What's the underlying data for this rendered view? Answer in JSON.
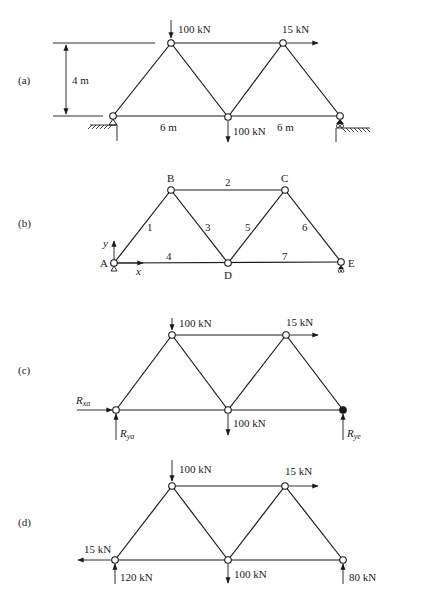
{
  "figure": {
    "panels": [
      {
        "id": "a",
        "label": "(a)",
        "dimensions": {
          "height": "4 m",
          "span_left": "6 m",
          "span_right": "6 m"
        },
        "loads": [
          {
            "node": "B",
            "value": "100 kN",
            "direction": "down"
          },
          {
            "node": "C",
            "value": "15 kN",
            "direction": "right"
          },
          {
            "node": "D",
            "value": "100 kN",
            "direction": "down"
          }
        ],
        "supports": [
          {
            "node": "A",
            "type": "pin"
          },
          {
            "node": "E",
            "type": "roller"
          }
        ]
      },
      {
        "id": "b",
        "label": "(b)",
        "nodes": [
          "A",
          "B",
          "C",
          "D",
          "E"
        ],
        "members": [
          {
            "id": "1",
            "from": "A",
            "to": "B"
          },
          {
            "id": "2",
            "from": "B",
            "to": "C"
          },
          {
            "id": "3",
            "from": "B",
            "to": "D"
          },
          {
            "id": "4",
            "from": "A",
            "to": "D"
          },
          {
            "id": "5",
            "from": "D",
            "to": "C"
          },
          {
            "id": "6",
            "from": "C",
            "to": "E"
          },
          {
            "id": "7",
            "from": "D",
            "to": "E"
          }
        ],
        "axes": {
          "x": "x",
          "y": "y"
        }
      },
      {
        "id": "c",
        "label": "(c)",
        "loads": [
          {
            "node": "B",
            "value": "100 kN",
            "direction": "down"
          },
          {
            "node": "C",
            "value": "15 kN",
            "direction": "right"
          },
          {
            "node": "D",
            "value": "100 kN",
            "direction": "down"
          }
        ],
        "reactions": [
          {
            "node": "A",
            "symbol": "R",
            "subscript": "xa",
            "direction": "right"
          },
          {
            "node": "A",
            "symbol": "R",
            "subscript": "ya",
            "direction": "up"
          },
          {
            "node": "E",
            "symbol": "R",
            "subscript": "ye",
            "direction": "up"
          }
        ]
      },
      {
        "id": "d",
        "label": "(d)",
        "loads": [
          {
            "node": "B",
            "value": "100 kN",
            "direction": "down"
          },
          {
            "node": "C",
            "value": "15 kN",
            "direction": "right"
          },
          {
            "node": "D",
            "value": "100 kN",
            "direction": "down"
          }
        ],
        "reactions": [
          {
            "node": "A",
            "value": "15 kN",
            "direction": "left"
          },
          {
            "node": "A",
            "value": "120 kN",
            "direction": "up"
          },
          {
            "node": "E",
            "value": "80 kN",
            "direction": "up"
          }
        ]
      }
    ]
  },
  "text": {
    "a": {
      "label": "(a)",
      "h": "4 m",
      "s1": "6 m",
      "s2": "6 m",
      "pB": "100 kN",
      "pC": "15 kN",
      "pD": "100 kN"
    },
    "b": {
      "label": "(b)",
      "A": "A",
      "B": "B",
      "C": "C",
      "D": "D",
      "E": "E",
      "m1": "1",
      "m2": "2",
      "m3": "3",
      "m4": "4",
      "m5": "5",
      "m6": "6",
      "m7": "7",
      "ax": "x",
      "ay": "y"
    },
    "c": {
      "label": "(c)",
      "pB": "100 kN",
      "pC": "15 kN",
      "pD": "100 kN",
      "R": "R",
      "xa": "xa",
      "ya": "ya",
      "ye": "ye"
    },
    "d": {
      "label": "(d)",
      "pB": "100 kN",
      "pC": "15 kN",
      "pD": "100 kN",
      "rAx": "15 kN",
      "rAy": "120 kN",
      "rEy": "80 kN"
    }
  },
  "colors": {
    "ink": "#1a1a1a",
    "background": "#ffffff"
  }
}
